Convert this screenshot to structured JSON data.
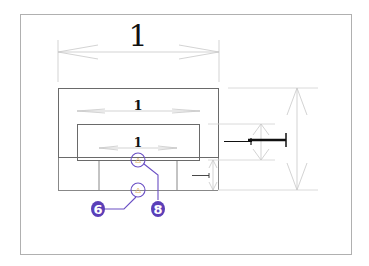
{
  "diagram": {
    "colors": {
      "frame": "#b0b0b0",
      "outline": "#6a6a6a",
      "dimension": "#c8c8c8",
      "callout": "#6a4fc4",
      "callout_fill": "#5b3fb8",
      "text": "#111111"
    },
    "dimensions": {
      "top_overall": "1",
      "inner_width": "1",
      "slot_width": "1"
    },
    "callouts": [
      {
        "id": "6",
        "label": "6"
      },
      {
        "id": "8",
        "label": "8"
      }
    ]
  }
}
